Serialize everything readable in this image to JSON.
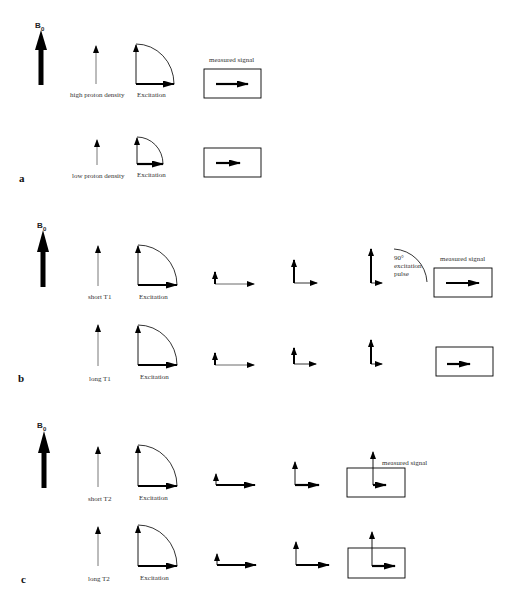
{
  "diagram": {
    "field_label": "B",
    "field_subscript": "0",
    "panels": [
      {
        "id": "a",
        "label": "a",
        "rows": [
          {
            "condition": "high proton density",
            "step_label": "Excitation",
            "signal_label": "measured signal",
            "magnetization": 1.0
          },
          {
            "condition": "low proton density",
            "step_label": "Excitation",
            "signal_label": "",
            "magnetization": 0.5
          }
        ]
      },
      {
        "id": "b",
        "label": "b",
        "pulse_label_lines": [
          "90°",
          "excitation",
          "pulse"
        ],
        "rows": [
          {
            "condition": "short T1",
            "step_label": "Excitation",
            "signal_label": "measured signal",
            "recovery": [
              0.2,
              0.5,
              0.9
            ],
            "signal": 1.0
          },
          {
            "condition": "long T1",
            "step_label": "Excitation",
            "signal_label": "",
            "recovery": [
              0.2,
              0.35,
              0.6
            ],
            "signal": 0.5
          }
        ]
      },
      {
        "id": "c",
        "label": "c",
        "rows": [
          {
            "condition": "short T2",
            "step_label": "Excitation",
            "signal_label": "measured signal",
            "dephasing": [
              1.0,
              0.6,
              0.3
            ]
          },
          {
            "condition": "long T2",
            "step_label": "Excitation",
            "signal_label": "",
            "dephasing": [
              1.0,
              0.9,
              0.6
            ]
          }
        ]
      }
    ]
  }
}
